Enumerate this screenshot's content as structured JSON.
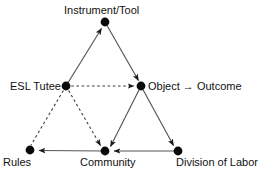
{
  "diagram": {
    "type": "activity-system-triangle",
    "title": "",
    "nodes": [
      {
        "id": "instrument",
        "label": "Instrument/Tool",
        "x": 105,
        "y": 22
      },
      {
        "id": "subject",
        "label": "ESL Tutee",
        "x": 66,
        "y": 86
      },
      {
        "id": "object",
        "label": "Object → Outcome",
        "x": 141,
        "y": 86
      },
      {
        "id": "rules",
        "label": "Rules",
        "x": 30,
        "y": 150
      },
      {
        "id": "community",
        "label": "Community",
        "x": 105,
        "y": 151
      },
      {
        "id": "division",
        "label": "Division of Labor",
        "x": 178,
        "y": 151
      }
    ],
    "edges": [
      {
        "from": "subject",
        "to": "instrument",
        "style": "solid",
        "arrow": "end"
      },
      {
        "from": "instrument",
        "to": "object",
        "style": "solid",
        "arrow": "end"
      },
      {
        "from": "subject",
        "to": "object",
        "style": "dashed",
        "arrow": "end"
      },
      {
        "from": "subject",
        "to": "rules",
        "style": "dashed",
        "arrow": "none"
      },
      {
        "from": "subject",
        "to": "community",
        "style": "dashed",
        "arrow": "end"
      },
      {
        "from": "object",
        "to": "community",
        "style": "solid",
        "arrow": "end"
      },
      {
        "from": "object",
        "to": "division",
        "style": "solid",
        "arrow": "end"
      },
      {
        "from": "division",
        "to": "community",
        "style": "solid",
        "arrow": "end"
      },
      {
        "from": "community",
        "to": "rules",
        "style": "solid",
        "arrow": "end"
      }
    ],
    "colors": {
      "line": "#4a4a4a",
      "node": "#0a0a0a",
      "text": "#111111",
      "background": "#ffffff"
    },
    "node_radius": 4.2
  }
}
